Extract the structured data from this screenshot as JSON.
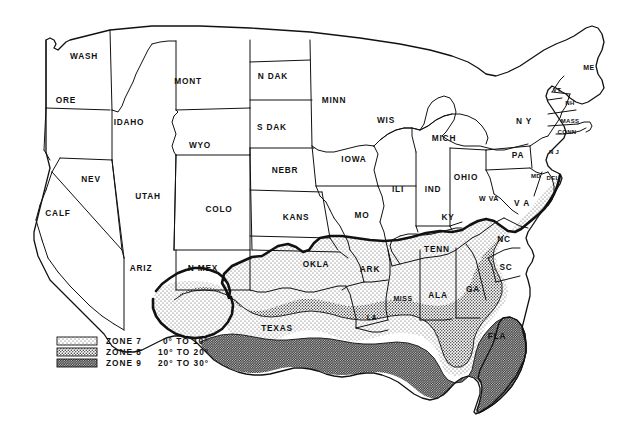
{
  "map": {
    "title": "United States temperature zone map",
    "background_color": "#ffffff",
    "line_color": "#111111",
    "states": [
      {
        "id": "wash",
        "label": "WASH",
        "x": 84,
        "y": 57
      },
      {
        "id": "ore",
        "label": "ORE",
        "x": 66,
        "y": 101
      },
      {
        "id": "idaho",
        "label": "IDAHO",
        "x": 129,
        "y": 123
      },
      {
        "id": "mont",
        "label": "MONT",
        "x": 188,
        "y": 82
      },
      {
        "id": "wyo",
        "label": "WYO",
        "x": 200,
        "y": 146
      },
      {
        "id": "ndak",
        "label": "N DAK",
        "x": 273,
        "y": 77
      },
      {
        "id": "sdak",
        "label": "S DAK",
        "x": 272,
        "y": 128
      },
      {
        "id": "nebr",
        "label": "NEBR",
        "x": 285,
        "y": 171
      },
      {
        "id": "kans",
        "label": "KANS",
        "x": 296,
        "y": 218
      },
      {
        "id": "minn",
        "label": "MINN",
        "x": 334,
        "y": 101
      },
      {
        "id": "iowa",
        "label": "IOWA",
        "x": 354,
        "y": 160
      },
      {
        "id": "mo",
        "label": "MO",
        "x": 362,
        "y": 216
      },
      {
        "id": "wis",
        "label": "WIS",
        "x": 386,
        "y": 121
      },
      {
        "id": "ili",
        "label": "ILI",
        "x": 398,
        "y": 190
      },
      {
        "id": "mich",
        "label": "MICH",
        "x": 444,
        "y": 139
      },
      {
        "id": "ind",
        "label": "IND",
        "x": 433,
        "y": 190
      },
      {
        "id": "ohio",
        "label": "OHIO",
        "x": 466,
        "y": 178
      },
      {
        "id": "ky",
        "label": "KY",
        "x": 448,
        "y": 218
      },
      {
        "id": "wva",
        "label": "W VA",
        "x": 489,
        "y": 199
      },
      {
        "id": "va",
        "label": "V A",
        "x": 522,
        "y": 204
      },
      {
        "id": "pa",
        "label": "PA",
        "x": 518,
        "y": 156
      },
      {
        "id": "ny",
        "label": "N Y",
        "x": 524,
        "y": 122
      },
      {
        "id": "nj",
        "label": "N J",
        "x": 554,
        "y": 152
      },
      {
        "id": "md",
        "label": "MD",
        "x": 536,
        "y": 176
      },
      {
        "id": "del",
        "label": "DEL",
        "x": 553,
        "y": 178
      },
      {
        "id": "vt",
        "label": "VT",
        "x": 557,
        "y": 90
      },
      {
        "id": "nh",
        "label": "NH",
        "x": 570,
        "y": 103
      },
      {
        "id": "me",
        "label": "ME",
        "x": 589,
        "y": 68
      },
      {
        "id": "mass",
        "label": "MASS",
        "x": 570,
        "y": 121
      },
      {
        "id": "conn",
        "label": "CONN",
        "x": 567,
        "y": 132
      },
      {
        "id": "nev",
        "label": "NEV",
        "x": 91,
        "y": 180
      },
      {
        "id": "calf",
        "label": "CALF",
        "x": 58,
        "y": 214
      },
      {
        "id": "utah",
        "label": "UTAH",
        "x": 148,
        "y": 197
      },
      {
        "id": "colo",
        "label": "COLO",
        "x": 219,
        "y": 210
      },
      {
        "id": "ariz",
        "label": "ARIZ",
        "x": 141,
        "y": 269
      },
      {
        "id": "nmex",
        "label": "N MEX",
        "x": 203,
        "y": 269
      },
      {
        "id": "okla",
        "label": "OKLA",
        "x": 316,
        "y": 265
      },
      {
        "id": "ark",
        "label": "ARK",
        "x": 370,
        "y": 270
      },
      {
        "id": "texas",
        "label": "TEXAS",
        "x": 277,
        "y": 329
      },
      {
        "id": "la",
        "label": "LA",
        "x": 372,
        "y": 318
      },
      {
        "id": "miss",
        "label": "MISS",
        "x": 403,
        "y": 299
      },
      {
        "id": "ala",
        "label": "ALA",
        "x": 438,
        "y": 296
      },
      {
        "id": "ga",
        "label": "GA",
        "x": 473,
        "y": 290
      },
      {
        "id": "tenn",
        "label": "TENN",
        "x": 437,
        "y": 250
      },
      {
        "id": "nc",
        "label": "NC",
        "x": 504,
        "y": 240
      },
      {
        "id": "sc",
        "label": "SC",
        "x": 506,
        "y": 268
      },
      {
        "id": "fla",
        "label": "FLA",
        "x": 497,
        "y": 337
      }
    ]
  },
  "legend": {
    "title": "Temperature zone legend",
    "items": [
      {
        "id": "zone-7",
        "zone": "ZONE 7",
        "range": "0° TO 10°",
        "pattern": "light-stipple"
      },
      {
        "id": "zone-8",
        "zone": "ZONE 8",
        "range": "10° TO 20°",
        "pattern": "medium-stipple"
      },
      {
        "id": "zone-9",
        "zone": "ZONE 9",
        "range": "20° TO 30°",
        "pattern": "dark-stipple"
      }
    ]
  }
}
